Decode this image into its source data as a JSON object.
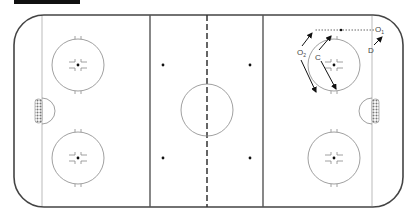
{
  "diagram": {
    "type": "hockey-rink-drill",
    "colors": {
      "boards": "#444444",
      "lines": "#555555",
      "circles": "#888888",
      "arrows": "#111111",
      "crease": "#999999"
    },
    "players": [
      {
        "id": "O1",
        "label": "O",
        "sub": "1",
        "x": 377,
        "y": 30
      },
      {
        "id": "O2",
        "label": "O",
        "sub": "2",
        "x": 301,
        "y": 52
      },
      {
        "id": "C",
        "label": "C",
        "sub": "",
        "x": 318,
        "y": 57
      },
      {
        "id": "D",
        "label": "D",
        "sub": "",
        "x": 371,
        "y": 50
      }
    ]
  }
}
